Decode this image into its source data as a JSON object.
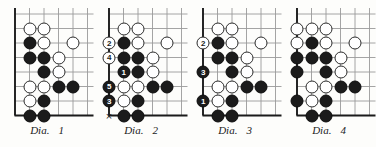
{
  "figure": {
    "type": "go-game-diagram-set",
    "background_color": "#fdfdfb",
    "line_color": "#9a9a9a",
    "edge_color": "#1b1b1b",
    "black_stone_color": "#1b1b1b",
    "white_stone_color": "#ffffff",
    "grid": {
      "columns": 6,
      "rows": 8,
      "cell_size_px": 14.5,
      "edges_drawn": [
        "left",
        "bottom"
      ]
    }
  },
  "diagrams": [
    {
      "id": "dia-1",
      "caption_label": "Dia.",
      "caption_index": "1",
      "stones": [
        {
          "col": 1,
          "row": 1,
          "color": "white"
        },
        {
          "col": 2,
          "row": 1,
          "color": "white"
        },
        {
          "col": 1,
          "row": 2,
          "color": "black"
        },
        {
          "col": 2,
          "row": 2,
          "color": "white"
        },
        {
          "col": 4,
          "row": 2,
          "color": "white"
        },
        {
          "col": 1,
          "row": 3,
          "color": "black"
        },
        {
          "col": 2,
          "row": 3,
          "color": "black"
        },
        {
          "col": 3,
          "row": 3,
          "color": "white"
        },
        {
          "col": 2,
          "row": 4,
          "color": "black"
        },
        {
          "col": 3,
          "row": 4,
          "color": "white"
        },
        {
          "col": 1,
          "row": 5,
          "color": "white"
        },
        {
          "col": 2,
          "row": 5,
          "color": "white"
        },
        {
          "col": 3,
          "row": 5,
          "color": "black"
        },
        {
          "col": 4,
          "row": 5,
          "color": "black"
        },
        {
          "col": 1,
          "row": 6,
          "color": "white"
        },
        {
          "col": 2,
          "row": 6,
          "color": "black"
        },
        {
          "col": 1,
          "row": 7,
          "color": "black"
        },
        {
          "col": 2,
          "row": 7,
          "color": "black"
        }
      ],
      "marks": []
    },
    {
      "id": "dia-2",
      "caption_label": "Dia.",
      "caption_index": "2",
      "stones": [
        {
          "col": 1,
          "row": 1,
          "color": "white"
        },
        {
          "col": 2,
          "row": 1,
          "color": "white"
        },
        {
          "col": 0,
          "row": 2,
          "color": "white",
          "number": "2",
          "outside": true
        },
        {
          "col": 1,
          "row": 2,
          "color": "black"
        },
        {
          "col": 2,
          "row": 2,
          "color": "white"
        },
        {
          "col": 4,
          "row": 2,
          "color": "white"
        },
        {
          "col": 0,
          "row": 3,
          "color": "white",
          "number": "4",
          "outside": true
        },
        {
          "col": 1,
          "row": 3,
          "color": "black"
        },
        {
          "col": 2,
          "row": 3,
          "color": "black"
        },
        {
          "col": 3,
          "row": 3,
          "color": "white"
        },
        {
          "col": 1,
          "row": 4,
          "color": "black",
          "number": "1"
        },
        {
          "col": 2,
          "row": 4,
          "color": "black"
        },
        {
          "col": 3,
          "row": 4,
          "color": "white"
        },
        {
          "col": 0,
          "row": 5,
          "color": "black",
          "number": "5",
          "outside": true
        },
        {
          "col": 1,
          "row": 5,
          "color": "white"
        },
        {
          "col": 2,
          "row": 5,
          "color": "white"
        },
        {
          "col": 3,
          "row": 5,
          "color": "black"
        },
        {
          "col": 4,
          "row": 5,
          "color": "black"
        },
        {
          "col": 0,
          "row": 6,
          "color": "black",
          "number": "3",
          "outside": true
        },
        {
          "col": 1,
          "row": 6,
          "color": "white"
        },
        {
          "col": 2,
          "row": 6,
          "color": "black"
        },
        {
          "col": 1,
          "row": 7,
          "color": "black"
        },
        {
          "col": 2,
          "row": 7,
          "color": "black"
        }
      ],
      "marks": [
        {
          "col": 0,
          "row": 7,
          "glyph": "×",
          "name": "x-mark",
          "outside": true
        }
      ]
    },
    {
      "id": "dia-3",
      "caption_label": "Dia.",
      "caption_index": "3",
      "stones": [
        {
          "col": 1,
          "row": 1,
          "color": "white"
        },
        {
          "col": 2,
          "row": 1,
          "color": "white"
        },
        {
          "col": 0,
          "row": 2,
          "color": "white",
          "number": "2",
          "outside": true
        },
        {
          "col": 1,
          "row": 2,
          "color": "black"
        },
        {
          "col": 2,
          "row": 2,
          "color": "white"
        },
        {
          "col": 4,
          "row": 2,
          "color": "white"
        },
        {
          "col": 1,
          "row": 3,
          "color": "black"
        },
        {
          "col": 2,
          "row": 3,
          "color": "black"
        },
        {
          "col": 3,
          "row": 3,
          "color": "white"
        },
        {
          "col": 0,
          "row": 4,
          "color": "black",
          "number": "3",
          "outside": true
        },
        {
          "col": 2,
          "row": 4,
          "color": "black"
        },
        {
          "col": 3,
          "row": 4,
          "color": "white"
        },
        {
          "col": 1,
          "row": 5,
          "color": "white"
        },
        {
          "col": 2,
          "row": 5,
          "color": "white"
        },
        {
          "col": 3,
          "row": 5,
          "color": "black"
        },
        {
          "col": 4,
          "row": 5,
          "color": "black"
        },
        {
          "col": 0,
          "row": 6,
          "color": "black",
          "number": "1",
          "outside": true
        },
        {
          "col": 1,
          "row": 6,
          "color": "white"
        },
        {
          "col": 2,
          "row": 6,
          "color": "black"
        },
        {
          "col": 1,
          "row": 7,
          "color": "black"
        },
        {
          "col": 2,
          "row": 7,
          "color": "black"
        }
      ],
      "marks": []
    },
    {
      "id": "dia-4",
      "caption_label": "Dia.",
      "caption_index": "4",
      "stones": [
        {
          "col": 0,
          "row": 1,
          "color": "white"
        },
        {
          "col": 1,
          "row": 1,
          "color": "white"
        },
        {
          "col": 2,
          "row": 1,
          "color": "white"
        },
        {
          "col": 0,
          "row": 2,
          "color": "white"
        },
        {
          "col": 1,
          "row": 2,
          "color": "black"
        },
        {
          "col": 2,
          "row": 2,
          "color": "white"
        },
        {
          "col": 4,
          "row": 2,
          "color": "white"
        },
        {
          "col": 0,
          "row": 3,
          "color": "black"
        },
        {
          "col": 1,
          "row": 3,
          "color": "black"
        },
        {
          "col": 2,
          "row": 3,
          "color": "black"
        },
        {
          "col": 3,
          "row": 3,
          "color": "white"
        },
        {
          "col": 0,
          "row": 4,
          "color": "black"
        },
        {
          "col": 2,
          "row": 4,
          "color": "black"
        },
        {
          "col": 3,
          "row": 4,
          "color": "white"
        },
        {
          "col": 1,
          "row": 5,
          "color": "white"
        },
        {
          "col": 2,
          "row": 5,
          "color": "white"
        },
        {
          "col": 3,
          "row": 5,
          "color": "black"
        },
        {
          "col": 4,
          "row": 5,
          "color": "black"
        },
        {
          "col": 0,
          "row": 6,
          "color": "black"
        },
        {
          "col": 1,
          "row": 6,
          "color": "white"
        },
        {
          "col": 2,
          "row": 6,
          "color": "black"
        },
        {
          "col": 1,
          "row": 7,
          "color": "black"
        },
        {
          "col": 2,
          "row": 7,
          "color": "black"
        }
      ],
      "marks": []
    }
  ]
}
